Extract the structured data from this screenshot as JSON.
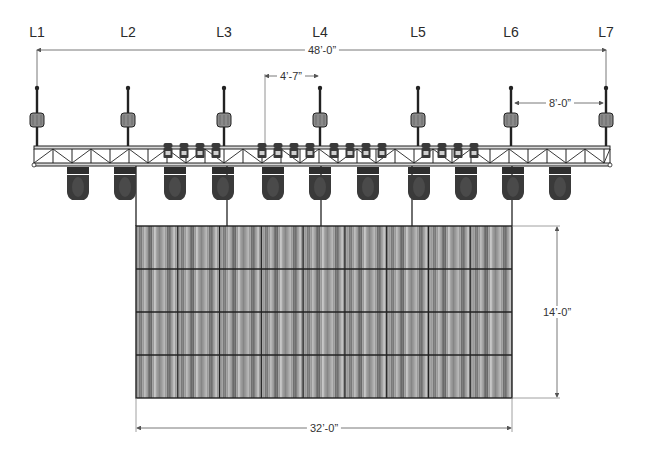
{
  "diagram": {
    "type": "rigging elevation",
    "hoist_points": [
      {
        "label": "L1",
        "x": 37
      },
      {
        "label": "L2",
        "x": 128
      },
      {
        "label": "L3",
        "x": 224
      },
      {
        "label": "L4",
        "x": 320
      },
      {
        "label": "L5",
        "x": 418
      },
      {
        "label": "L6",
        "x": 511
      },
      {
        "label": "L7",
        "x": 606
      }
    ],
    "dimensions": {
      "overall_truss": "48’-0”",
      "hoist_offset": "4’-7”",
      "end_spacing": "8’-0”",
      "wall_height": "14’-0”",
      "wall_width": "32’-0”"
    },
    "truss": {
      "x1": 34,
      "x2": 610,
      "top": 146,
      "bottom": 166
    },
    "moving_heads_x": [
      78,
      125,
      175,
      223,
      273,
      320,
      368,
      419,
      466,
      513,
      560
    ],
    "truss_fixture_groups": [
      [
        168,
        184,
        200,
        216
      ],
      [
        262,
        278,
        294,
        310
      ],
      [
        334,
        350,
        366,
        382
      ],
      [
        426,
        442,
        458,
        474
      ]
    ],
    "video_wall": {
      "x": 136,
      "y": 226,
      "width": 376,
      "height": 172,
      "rows": 4,
      "cols": 9
    },
    "drop_lines_x": [
      136,
      227,
      321,
      412,
      512
    ],
    "colors": {
      "line": "#222222",
      "dim_line": "#555555",
      "fixture": "#3a3a3a",
      "panel": "#9a9a9a",
      "panel_dark": "#6e6e6e",
      "motor": "#8a8a8a"
    }
  }
}
